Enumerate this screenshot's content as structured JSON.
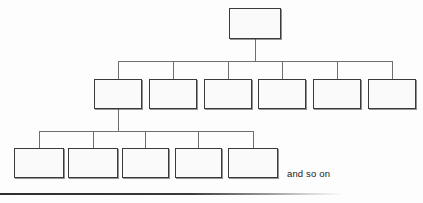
{
  "figure": {
    "kind": "hierarchy-tree-diagram",
    "title": "",
    "caption": "and so on",
    "background_color": "#fdfdfd",
    "box_fill_color": "#fafafa",
    "box_border_color": "#3a3a3a",
    "connector_color": "#6f6f6f",
    "caption_color": "#1b1b1b",
    "base_rule_color": "#2e2e2e"
  },
  "levels": [
    {
      "name": "root-level",
      "index": 0,
      "node_count": 1,
      "label": "",
      "nodes": [
        {
          "name": "root-node",
          "label": "",
          "x": 229,
          "y": 8,
          "w": 52,
          "h": 31
        }
      ]
    },
    {
      "name": "second-level",
      "index": 1,
      "node_count": 6,
      "label": "",
      "nodes": [
        {
          "name": "level2-node-1",
          "label": "",
          "x": 94,
          "y": 79,
          "w": 48,
          "h": 30
        },
        {
          "name": "level2-node-2",
          "label": "",
          "x": 149,
          "y": 79,
          "w": 48,
          "h": 30
        },
        {
          "name": "level2-node-3",
          "label": "",
          "x": 204,
          "y": 79,
          "w": 48,
          "h": 30
        },
        {
          "name": "level2-node-4",
          "label": "",
          "x": 258,
          "y": 79,
          "w": 48,
          "h": 30
        },
        {
          "name": "level2-node-5",
          "label": "",
          "x": 313,
          "y": 79,
          "w": 48,
          "h": 30
        },
        {
          "name": "level2-node-6",
          "label": "",
          "x": 368,
          "y": 79,
          "w": 48,
          "h": 30
        }
      ]
    },
    {
      "name": "third-level",
      "index": 2,
      "node_count": 5,
      "label": "",
      "nodes": [
        {
          "name": "level3-node-1",
          "label": "",
          "x": 14,
          "y": 148,
          "w": 50,
          "h": 30
        },
        {
          "name": "level3-node-2",
          "label": "",
          "x": 68,
          "y": 148,
          "w": 50,
          "h": 30
        },
        {
          "name": "level3-node-3",
          "label": "",
          "x": 122,
          "y": 148,
          "w": 47,
          "h": 30
        },
        {
          "name": "level3-node-4",
          "label": "",
          "x": 175,
          "y": 148,
          "w": 47,
          "h": 30
        },
        {
          "name": "level3-node-5",
          "label": "",
          "x": 228,
          "y": 148,
          "w": 50,
          "h": 30
        }
      ]
    }
  ],
  "connectors": {
    "root_stem": {
      "x": 255,
      "y_from": 39,
      "y_to": 61
    },
    "level2_bus": {
      "y": 61,
      "x_from": 118,
      "x_to": 392
    },
    "level2_drops_x": [
      118,
      173,
      228,
      282,
      337,
      392
    ],
    "level2_drop": {
      "y_from": 61,
      "y_to": 79
    },
    "parent_stem_level3": {
      "x": 118,
      "y_from": 109,
      "y_to": 131
    },
    "level3_bus": {
      "y": 131,
      "x_from": 39,
      "x_to": 253
    },
    "level3_drops_x": [
      39,
      93,
      145,
      198,
      253
    ],
    "level3_drop": {
      "y_from": 131,
      "y_to": 148
    }
  },
  "caption": {
    "text": "and so on",
    "x": 287,
    "y": 168
  },
  "base_rule": {
    "x": 0,
    "y": 193,
    "width": 345
  }
}
